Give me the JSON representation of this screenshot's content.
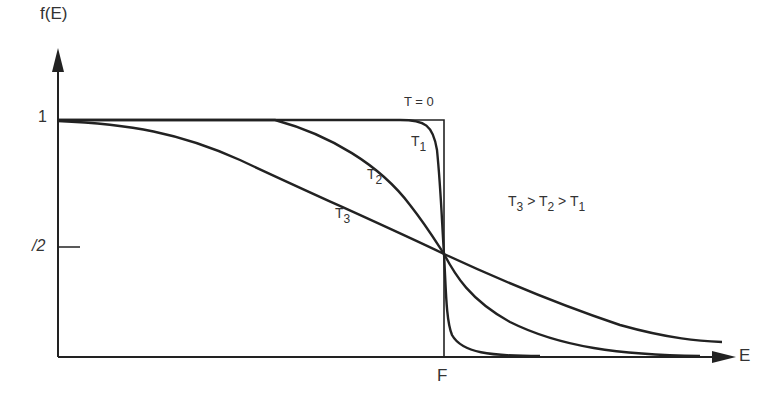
{
  "axes": {
    "y_label": "f(E)",
    "x_label": "E",
    "y_tick_one": "1",
    "y_tick_half": "/2",
    "x_tick_fermi": "F"
  },
  "curves": [
    {
      "name": "T = 0",
      "label": "T = 0"
    },
    {
      "name": "T1",
      "label_main": "T",
      "label_sub": "1"
    },
    {
      "name": "T2",
      "label_main": "T",
      "label_sub": "2"
    },
    {
      "name": "T3",
      "label_main": "T",
      "label_sub": "3"
    }
  ],
  "relation": {
    "t3": "T",
    "s3": "3",
    "gt1": ">",
    "t2": "T",
    "s2": "2",
    "gt2": ">",
    "t1": "T",
    "s1": "1"
  },
  "colors": {
    "line": "#222222",
    "text": "#333333"
  }
}
